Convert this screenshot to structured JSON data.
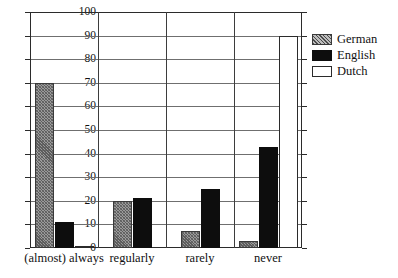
{
  "chart_data": {
    "type": "bar",
    "title": "",
    "xlabel": "",
    "ylabel": "",
    "ylim": [
      0,
      100
    ],
    "ytick_step": 10,
    "yticks": [
      0,
      10,
      20,
      30,
      40,
      50,
      60,
      70,
      80,
      90,
      100
    ],
    "grid": true,
    "legend_position": "right",
    "categories": [
      "(almost) always",
      "regularly",
      "rarely",
      "never"
    ],
    "series": [
      {
        "name": "German",
        "pattern": "diagonal-hatch",
        "color": "#9a9a9a",
        "values": [
          70,
          20,
          7,
          3
        ]
      },
      {
        "name": "English",
        "pattern": "solid-fill",
        "color": "#0d0d0d",
        "values": [
          11,
          21,
          25,
          43
        ]
      },
      {
        "name": "Dutch",
        "pattern": "empty-outline",
        "color": "#ffffff",
        "values": [
          1,
          0,
          0,
          90
        ]
      }
    ]
  },
  "legend": {
    "entries": [
      {
        "label": "German",
        "swatch": "hatched-swatch-icon"
      },
      {
        "label": "English",
        "swatch": "black-swatch-icon"
      },
      {
        "label": "Dutch",
        "swatch": "white-swatch-icon"
      }
    ]
  },
  "axis": {
    "frame_color": "#2b2b2b",
    "gridline_color": "#6f6f6f"
  }
}
